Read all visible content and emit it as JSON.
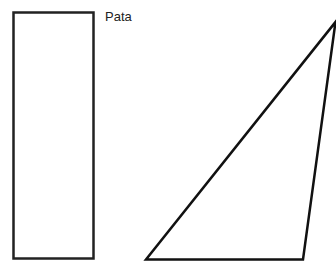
{
  "diagram": {
    "rectangle": {
      "label": "Pata",
      "x": 13,
      "y": 12,
      "width": 81,
      "height": 247,
      "stroke": "#222222"
    },
    "triangle": {
      "points": [
        [
          146,
          259
        ],
        [
          303,
          259
        ],
        [
          336,
          22
        ]
      ],
      "stroke": "#111111"
    }
  }
}
